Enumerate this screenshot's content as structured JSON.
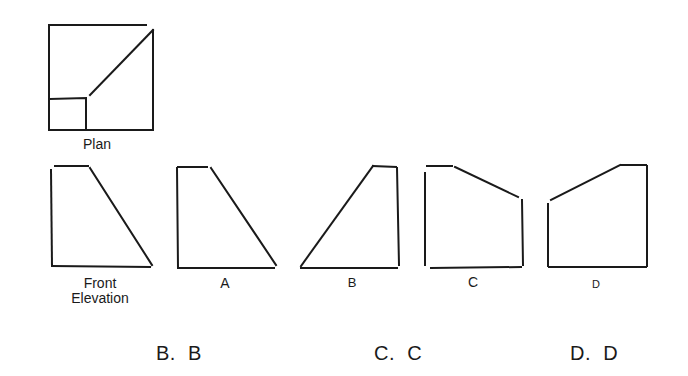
{
  "figure": {
    "plan_label": "Plan",
    "front_label_line1": "Front",
    "front_label_line2": "Elevation",
    "options": [
      {
        "key": "A",
        "label": "A"
      },
      {
        "key": "B",
        "label": "B"
      },
      {
        "key": "C",
        "label": "C"
      },
      {
        "key": "D",
        "label": "D"
      }
    ]
  },
  "answers": [
    {
      "prefix": "B.",
      "value": "B"
    },
    {
      "prefix": "C.",
      "value": "C"
    },
    {
      "prefix": "D.",
      "value": "D"
    }
  ],
  "colors": {
    "stroke": "#1a1a1a",
    "background": "#ffffff"
  }
}
